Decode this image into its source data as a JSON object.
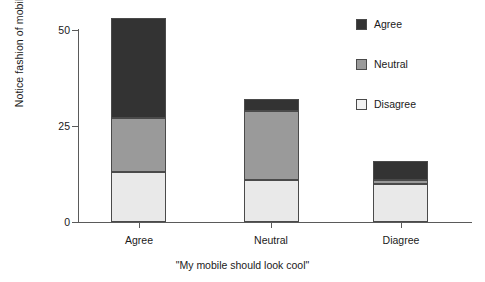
{
  "chart_data": {
    "type": "bar",
    "subtype": "stacked-bar",
    "title": "",
    "xlabel": "\"My mobile should look cool\"",
    "ylabel": "Notice fashion of mobiles (number)",
    "categories": [
      "Agree",
      "Neutral",
      "Diagree"
    ],
    "ylim": [
      0,
      55
    ],
    "yticks": [
      0,
      25,
      50
    ],
    "ytick_labels": [
      "0",
      "25",
      "50"
    ],
    "grid": false,
    "legend_position": "top-right",
    "stack_order_bottom_to_top": [
      "Disagree",
      "Neutral",
      "Agree"
    ],
    "series": [
      {
        "name": "Disagree",
        "color": "#e9e9e9",
        "values": [
          13,
          11,
          10
        ]
      },
      {
        "name": "Neutral",
        "color": "#9a9a9a",
        "values": [
          14,
          18,
          1
        ]
      },
      {
        "name": "Agree",
        "color": "#333333",
        "values": [
          26,
          3,
          5
        ]
      }
    ],
    "totals": [
      53,
      32,
      16
    ]
  },
  "legend": {
    "items": [
      {
        "label": "Agree",
        "swatch": "legend-swatch-agree"
      },
      {
        "label": "Neutral",
        "swatch": "legend-swatch-neutral"
      },
      {
        "label": "Disagree",
        "swatch": "legend-swatch-disagree"
      }
    ]
  }
}
